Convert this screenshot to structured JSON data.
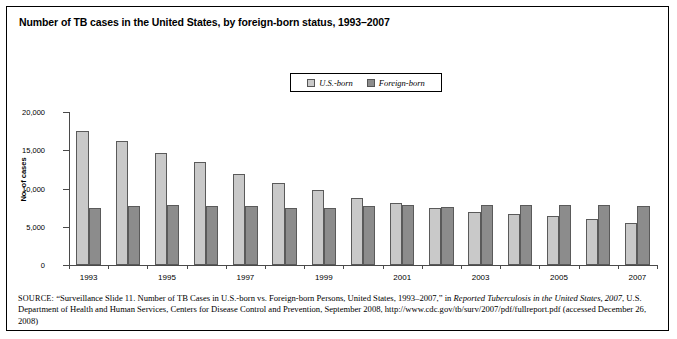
{
  "figure": {
    "title": "Number of TB cases in the United States, by foreign-born status, 1993–2007",
    "source_prefix": "SOURCE:",
    "source_part1": " “Surveillance Slide 11. Number of TB Cases in U.S.-born vs. Foreign-born Persons, United States, 1993–2007,” in ",
    "source_italic1": "Reported Tuberculosis in the United States, 2007",
    "source_part2": ", U.S. Department of Health and Human Services, Centers for Disease Control and Prevention, September 2008, http://www.cdc.gov/tb/surv/2007/pdf/fullreport.pdf (accessed December 26, 2008)"
  },
  "legend": {
    "items": [
      {
        "label": "U.S.-born",
        "color": "#c9c9c9",
        "swatch_name": "legend-swatch-us-born"
      },
      {
        "label": "Foreign-born",
        "color": "#8c8c8c",
        "swatch_name": "legend-swatch-foreign-born"
      }
    ]
  },
  "chart_data": {
    "type": "bar",
    "title": "Number of TB cases in the United States, by foreign-born status, 1993–2007",
    "xlabel": "",
    "ylabel": "No. of cases",
    "ylim": [
      0,
      20000
    ],
    "yticks": [
      0,
      5000,
      10000,
      15000,
      20000
    ],
    "ytick_labels": [
      "0",
      "5,000",
      "10,000",
      "15,000",
      "20,000"
    ],
    "grid": false,
    "legend_position": "top-center",
    "categories": [
      1993,
      1994,
      1995,
      1996,
      1997,
      1998,
      1999,
      2000,
      2001,
      2002,
      2003,
      2004,
      2005,
      2006,
      2007
    ],
    "xtick_labels": [
      "1993",
      "",
      "1995",
      "",
      "1997",
      "",
      "1999",
      "",
      "2001",
      "",
      "2003",
      "",
      "2005",
      "",
      "2007"
    ],
    "series": [
      {
        "name": "U.S.-born",
        "color": "#c9c9c9",
        "values": [
          17500,
          16200,
          14700,
          13400,
          11900,
          10700,
          9800,
          8700,
          8100,
          7500,
          6900,
          6700,
          6400,
          6000,
          5500
        ]
      },
      {
        "name": "Foreign-born",
        "color": "#8c8c8c",
        "values": [
          7400,
          7700,
          7900,
          7700,
          7700,
          7400,
          7500,
          7700,
          7900,
          7600,
          7800,
          7800,
          7900,
          7800,
          7700
        ]
      }
    ]
  }
}
